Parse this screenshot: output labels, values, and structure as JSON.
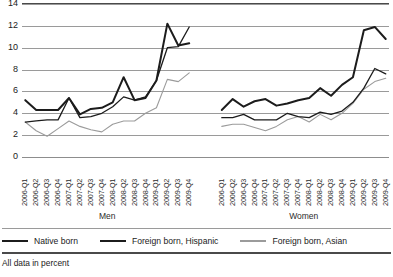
{
  "chart_data": {
    "type": "line",
    "title": "",
    "subtitle": "",
    "xlabel": "",
    "ylabel": "",
    "ylim": [
      0,
      14
    ],
    "yticks": [
      0,
      2,
      4,
      6,
      8,
      10,
      12,
      14
    ],
    "grid": true,
    "legend_position": "bottom",
    "footnote": "All data in percent",
    "groups": [
      {
        "name": "Men",
        "categories": [
          "2006-Q1",
          "2006-Q2",
          "2006-Q3",
          "2006-Q4",
          "2007-Q1",
          "2007-Q2",
          "2007-Q3",
          "2007-Q4",
          "2008-Q1",
          "2008-Q2",
          "2008-Q3",
          "2008-Q4",
          "2009-Q1",
          "2009-Q2",
          "2009-Q3",
          "2009-Q4"
        ],
        "series": [
          {
            "name": "Native born",
            "color": "#1c1c1c",
            "width": 2.0,
            "values": [
              5.2,
              4.3,
              4.3,
              4.3,
              5.4,
              3.9,
              4.4,
              4.5,
              5.0,
              7.3,
              5.2,
              5.4,
              7.0,
              12.2,
              10.2,
              10.4
            ]
          },
          {
            "name": "Foreign born, Hispanic",
            "color": "#1c1c1c",
            "width": 1.3,
            "values": [
              3.2,
              3.3,
              3.4,
              3.4,
              5.4,
              3.6,
              3.7,
              4.0,
              4.6,
              5.5,
              5.2,
              5.5,
              7.0,
              10.0,
              10.1,
              11.9
            ]
          },
          {
            "name": "Foreign born, Asian",
            "color": "#9b9b9b",
            "width": 1.1,
            "values": [
              3.2,
              2.4,
              1.9,
              2.6,
              3.3,
              2.8,
              2.5,
              2.3,
              3.0,
              3.3,
              3.3,
              4.0,
              4.5,
              7.1,
              6.9,
              7.7
            ]
          }
        ]
      },
      {
        "name": "Women",
        "categories": [
          "2006-Q1",
          "2006-Q2",
          "2006-Q3",
          "2006-Q4",
          "2007-Q1",
          "2007-Q2",
          "2007-Q3",
          "2007-Q4",
          "2008-Q1",
          "2008-Q2",
          "2008-Q3",
          "2008-Q4",
          "2009-Q1",
          "2009-Q2",
          "2009-Q3",
          "2009-Q4"
        ],
        "series": [
          {
            "name": "Native born",
            "color": "#1c1c1c",
            "width": 2.0,
            "values": [
              4.3,
              5.3,
              4.6,
              5.1,
              5.3,
              4.7,
              4.9,
              5.2,
              5.4,
              6.3,
              5.6,
              6.6,
              7.3,
              11.6,
              11.9,
              10.8
            ]
          },
          {
            "name": "Foreign born, Hispanic",
            "color": "#1c1c1c",
            "width": 1.3,
            "values": [
              3.6,
              3.6,
              3.9,
              3.4,
              3.4,
              3.4,
              4.0,
              3.7,
              3.6,
              4.1,
              3.9,
              4.2,
              5.0,
              6.3,
              8.1,
              7.6
            ]
          },
          {
            "name": "Foreign born, Asian",
            "color": "#9b9b9b",
            "width": 1.1,
            "values": [
              2.8,
              3.0,
              3.0,
              2.7,
              2.4,
              2.8,
              3.4,
              3.7,
              3.2,
              3.9,
              3.4,
              4.0,
              4.9,
              6.2,
              6.9,
              7.2
            ]
          }
        ]
      }
    ],
    "legend": [
      {
        "label": "Native born",
        "swatch": "sw-native"
      },
      {
        "label": "Foreign born, Hispanic",
        "swatch": "sw-hispanic"
      },
      {
        "label": "Foreign born, Asian",
        "swatch": "sw-asian"
      }
    ]
  }
}
